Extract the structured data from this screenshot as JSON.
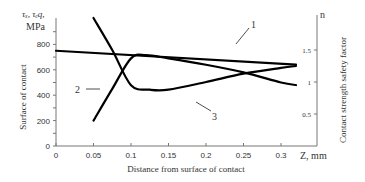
{
  "chart_data": {
    "type": "line",
    "title": "",
    "xlabel": "Distance from surface of contact",
    "x_unit_label": "Z, mm",
    "ylabel_left": "Surface of contact",
    "ylabel_left_top": "τₓ, τₑq,",
    "ylabel_left_unit": "MPa",
    "ylabel_right": "Contact strength safety factor",
    "ylabel_right_top": "n",
    "xlim": [
      0,
      0.33
    ],
    "ylim_left": [
      0,
      900
    ],
    "ylim_right": [
      0,
      2.1
    ],
    "x_ticks": [
      "0",
      "0.05",
      "0.1",
      "0.15",
      "0.2",
      "0.25",
      "0.3"
    ],
    "x_tick_values": [
      0,
      0.05,
      0.1,
      0.15,
      0.2,
      0.25,
      0.3
    ],
    "y_left_ticks": [
      "0",
      "200",
      "400",
      "600",
      "800"
    ],
    "y_left_tick_values": [
      0,
      200,
      400,
      600,
      800
    ],
    "y_right_ticks": [
      "0.5",
      "1",
      "1.5"
    ],
    "y_right_tick_values": [
      0.5,
      1,
      1.5
    ],
    "grid": false,
    "series": [
      {
        "name": "1",
        "axis": "left",
        "x": [
          0,
          0.32
        ],
        "values": [
          750,
          640
        ]
      },
      {
        "name": "2",
        "axis": "left",
        "x": [
          0.05,
          0.075,
          0.1,
          0.12,
          0.15,
          0.2,
          0.25,
          0.3,
          0.32
        ],
        "values": [
          200,
          450,
          690,
          715,
          690,
          640,
          580,
          500,
          480
        ]
      },
      {
        "name": "3",
        "axis": "right",
        "x": [
          0.05,
          0.075,
          0.1,
          0.125,
          0.15,
          0.2,
          0.25,
          0.3,
          0.32
        ],
        "values": [
          2.0,
          1.5,
          0.95,
          0.88,
          0.88,
          1.0,
          1.13,
          1.22,
          1.25
        ]
      }
    ],
    "annotations": [
      {
        "text": "1",
        "target": "series-1"
      },
      {
        "text": "2",
        "target": "series-2"
      },
      {
        "text": "3",
        "target": "series-3"
      }
    ]
  }
}
